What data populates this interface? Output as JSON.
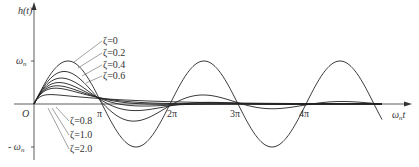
{
  "chart_data": {
    "type": "line",
    "title": "",
    "ylabel": "h(t)",
    "xlabel": "ω_n t",
    "y_ticks": [
      "ω_n",
      "-ω_n"
    ],
    "x_ticks": [
      "O",
      "π",
      "2π",
      "3π",
      "4π"
    ],
    "xlim": [
      0,
      14.5
    ],
    "ylim": [
      -1.15,
      1.5
    ],
    "grid": false,
    "legend_position": "inline annotations",
    "formula": "h(t)/ω_n = e^(-ζ ω_n t) sin(√(1-ζ²) ω_n t)/√(1-ζ²)",
    "series": [
      {
        "name": "ζ=0",
        "zeta": 0,
        "samples": {
          "x": [
            0,
            1.571,
            3.142,
            4.712,
            6.283,
            7.854,
            9.425,
            10.996,
            12.566,
            14.137
          ],
          "y": [
            0,
            1.0,
            0,
            -1.0,
            0,
            1.0,
            0,
            -1.0,
            0,
            1.0
          ]
        }
      },
      {
        "name": "ζ=0.2",
        "zeta": 0.2,
        "samples": {
          "x": [
            0,
            1.571,
            3.142,
            4.712,
            6.283,
            7.854,
            9.425
          ],
          "y": [
            0,
            0.74,
            0.02,
            -0.39,
            0.0,
            0.2,
            0.0
          ]
        }
      },
      {
        "name": "ζ=0.4",
        "zeta": 0.4,
        "samples": {
          "x": [
            0,
            1.571,
            3.142,
            4.712,
            6.283
          ],
          "y": [
            0,
            0.55,
            0.09,
            -0.13,
            -0.03
          ]
        }
      },
      {
        "name": "ζ=0.6",
        "zeta": 0.6,
        "samples": {
          "x": [
            0,
            1.571,
            3.142,
            4.712,
            6.283
          ],
          "y": [
            0,
            0.39,
            0.11,
            -0.03,
            -0.02
          ]
        }
      },
      {
        "name": "ζ=0.8",
        "zeta": 0.8,
        "samples": {
          "x": [
            0,
            1.571,
            3.142,
            4.712,
            6.283
          ],
          "y": [
            0,
            0.28,
            0.09,
            0.01,
            -0.01
          ]
        }
      },
      {
        "name": "ζ=1.0",
        "zeta": 1.0,
        "samples": {
          "x": [
            0,
            1.0,
            1.571,
            3.142,
            4.712,
            6.283
          ],
          "y": [
            0,
            0.368,
            0.33,
            0.14,
            0.04,
            0.01
          ]
        }
      },
      {
        "name": "ζ=2.0",
        "zeta": 2.0,
        "samples": {
          "x": [
            0,
            0.5,
            1.571,
            3.142,
            4.712,
            6.283
          ],
          "y": [
            0,
            0.2,
            0.18,
            0.1,
            0.07,
            0.05
          ]
        }
      }
    ],
    "labels": {
      "y_axis": "h(t)",
      "x_axis": "ω",
      "x_axis_sub": "n",
      "x_axis_t": "t",
      "omega_n": "ω",
      "omega_n_sub": "n",
      "neg_omega_n": "- ω",
      "origin": "O",
      "pi": "π",
      "two_pi": "2π",
      "three_pi": "3π",
      "four_pi": "4π"
    }
  }
}
